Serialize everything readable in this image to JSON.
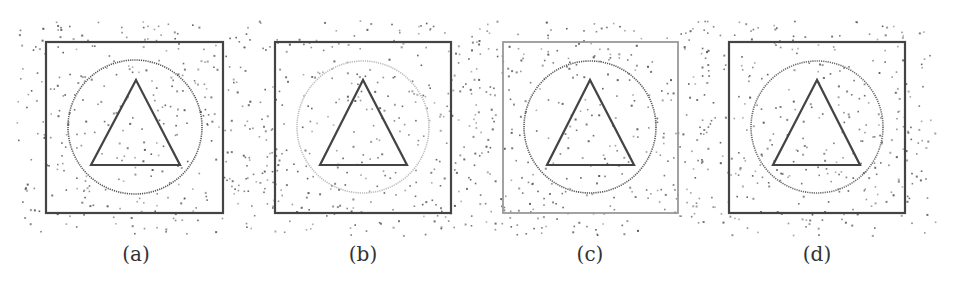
{
  "figure": {
    "noise_color": "#555555",
    "panels": [
      {
        "id": "a",
        "label": "(a)",
        "square": {
          "x": 46,
          "y": 42,
          "w": 177,
          "h": 171,
          "color": "#444444",
          "width": 2.2
        },
        "circle": {
          "cx": 135,
          "cy": 127,
          "r": 67,
          "color": "#555555",
          "width": 1.6,
          "dotted": true
        },
        "triangle": {
          "points": [
            [
              136,
              80
            ],
            [
              91,
              165
            ],
            [
              180,
              165
            ]
          ],
          "color": "#444444",
          "width": 2.2
        },
        "label_x": 136
      },
      {
        "id": "b",
        "label": "(b)",
        "square": {
          "x": 275,
          "y": 42,
          "w": 176,
          "h": 171,
          "color": "#444444",
          "width": 2.2
        },
        "circle": {
          "cx": 363,
          "cy": 127,
          "r": 66,
          "color": "#bbbbbb",
          "width": 1.6,
          "dotted": true
        },
        "triangle": {
          "points": [
            [
              363,
              80
            ],
            [
              320,
              165
            ],
            [
              407,
              165
            ]
          ],
          "color": "#444444",
          "width": 2.2
        },
        "label_x": 363
      },
      {
        "id": "c",
        "label": "(c)",
        "square": {
          "x": 503,
          "y": 42,
          "w": 175,
          "h": 171,
          "color": "#999999",
          "width": 1.8
        },
        "circle": {
          "cx": 590,
          "cy": 127,
          "r": 66,
          "color": "#555555",
          "width": 1.6,
          "dotted": true
        },
        "triangle": {
          "points": [
            [
              590,
              80
            ],
            [
              547,
              165
            ],
            [
              634,
              165
            ]
          ],
          "color": "#444444",
          "width": 2.2
        },
        "label_x": 590
      },
      {
        "id": "d",
        "label": "(d)",
        "square": {
          "x": 729,
          "y": 42,
          "w": 176,
          "h": 171,
          "color": "#444444",
          "width": 2.2
        },
        "circle": {
          "cx": 817,
          "cy": 127,
          "r": 66,
          "color": "#666666",
          "width": 1.6,
          "dotted": true
        },
        "triangle": {
          "points": [
            [
              817,
              80
            ],
            [
              773,
              165
            ],
            [
              860,
              165
            ]
          ],
          "color": "#444444",
          "width": 2.2
        },
        "label_x": 817
      }
    ]
  }
}
